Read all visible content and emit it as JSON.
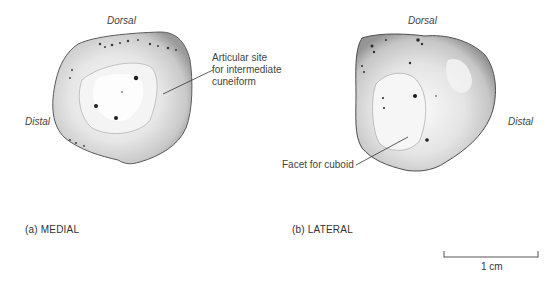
{
  "figure": {
    "panels": [
      {
        "id": "a",
        "caption": "(a) MEDIAL",
        "orientation_labels": {
          "top": "Dorsal",
          "left": "Distal"
        },
        "annotations": [
          {
            "lines": [
              "Articular site",
              "for intermediate",
              "cuneiform"
            ]
          }
        ]
      },
      {
        "id": "b",
        "caption": "(b) LATERAL",
        "orientation_labels": {
          "top": "Dorsal",
          "right": "Distal"
        },
        "annotations": [
          {
            "lines": [
              "Facet for cuboid"
            ]
          }
        ]
      }
    ],
    "scale_bar": {
      "label": "1 cm"
    }
  }
}
